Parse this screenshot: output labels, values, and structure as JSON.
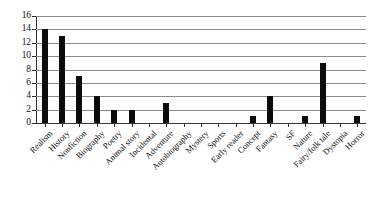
{
  "chart_data": {
    "type": "bar",
    "title": "",
    "subtitle": "",
    "xlabel": "",
    "ylabel": "",
    "ylim": [
      0,
      16
    ],
    "ytick_step": 2,
    "yticks": [
      0,
      2,
      4,
      6,
      8,
      10,
      12,
      14,
      16
    ],
    "grid": true,
    "legend": null,
    "legend_position": "none",
    "bar_color": "#0b0b0b",
    "gridline_color": "#8a8a8a",
    "axis_color": "#2b2b2b",
    "categories": [
      "Realism",
      "History",
      "Nonfiction",
      "Biography",
      "Poetry",
      "Animal story",
      "Incidental",
      "Adventure",
      "Autobiography",
      "Mystery",
      "Sports",
      "Early reader",
      "Concept",
      "Fantasy",
      "SF",
      "Nature",
      "Fairy/folk tale",
      "Dystopia",
      "Horror"
    ],
    "values": [
      14,
      13,
      7,
      4,
      2,
      2,
      0,
      3,
      0,
      0,
      0,
      0,
      1,
      4,
      0,
      1,
      9,
      0,
      1
    ]
  }
}
